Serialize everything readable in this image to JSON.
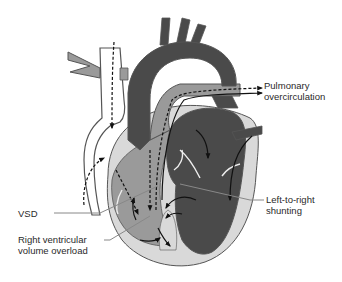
{
  "diagram": {
    "colors": {
      "oxygenated_dark": "#4a4a4a",
      "mixed_mid": "#9a9a9a",
      "myocardium_light": "#d9d9d9",
      "vessel_outline": "#555555",
      "arrow": "#111111",
      "leader_line": "#888888",
      "background": "#ffffff"
    },
    "labels": {
      "pulmonary": "Pulmonary\novercirculation",
      "vsd": "VSD",
      "rv_overload": "Right ventricular\nvolume overload",
      "shunting": "Left-to-right\nshunting"
    },
    "arrows": {
      "solid": "oxygenated blood flow",
      "dashed": "deoxygenated / venous return flow"
    }
  }
}
